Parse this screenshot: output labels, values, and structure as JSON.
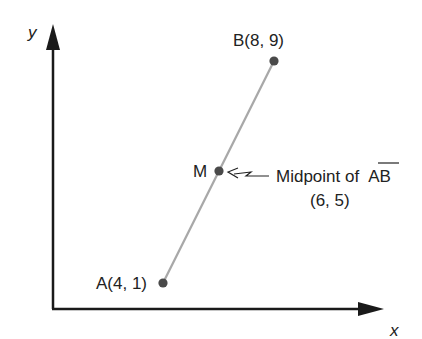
{
  "diagram": {
    "type": "coordinate-plane-midpoint",
    "axes": {
      "x_label": "x",
      "y_label": "y",
      "color": "#1a1a1a"
    },
    "points": [
      {
        "id": "A",
        "label": "A(4, 1)",
        "x": 4,
        "y": 1
      },
      {
        "id": "B",
        "label": "B(8, 9)",
        "x": 8,
        "y": 9
      },
      {
        "id": "M",
        "label": "M",
        "x": 6,
        "y": 5
      }
    ],
    "segment": {
      "from": "A",
      "to": "B",
      "color": "#a8a8a8"
    },
    "point_color": "#4a4a4a",
    "annotation": {
      "text_line1": "Midpoint of",
      "overline_text": "AB",
      "text_line2": "(6, 5)",
      "target": "M"
    }
  }
}
